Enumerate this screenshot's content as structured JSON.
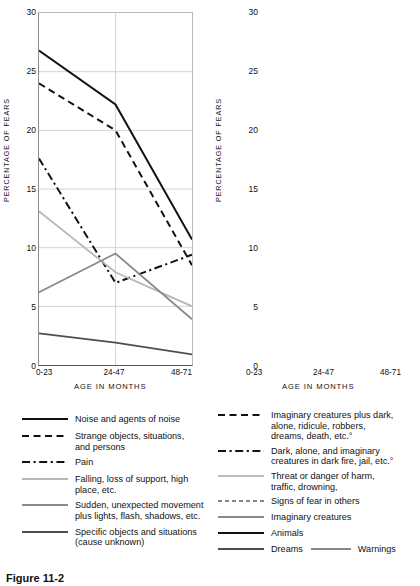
{
  "figure": {
    "caption": "Figure  11-2"
  },
  "axes": {
    "ylabel": "PERCENTAGE  OF  FEARS",
    "xlabel": "AGE  IN  MONTHS",
    "yticks": [
      "0",
      "5",
      "10",
      "15",
      "20",
      "25",
      "30"
    ],
    "xticks": [
      "0-23",
      "24-47",
      "48-71"
    ]
  },
  "chart_data": [
    {
      "type": "line",
      "title": "",
      "xlabel": "AGE  IN  MONTHS",
      "ylabel": "PERCENTAGE  OF  FEARS",
      "categories": [
        "0-23",
        "24-47",
        "48-71"
      ],
      "ylim": [
        0,
        30
      ],
      "yticks": [
        0,
        5,
        10,
        15,
        20,
        25,
        30
      ],
      "grid": true,
      "legend_position": "below",
      "series": [
        {
          "name": "Noise and  agents of noise",
          "values": [
            26.8,
            22.2,
            10.7
          ],
          "style": "solid",
          "color": "#111111",
          "width": 2.0
        },
        {
          "name": "Strange objects, situations,\n    and persons",
          "values": [
            24.0,
            20.0,
            8.5
          ],
          "style": "dashed",
          "color": "#111111",
          "width": 2.0
        },
        {
          "name": "Pain",
          "values": [
            17.6,
            7.0,
            9.4
          ],
          "style": "dashdot",
          "color": "#111111",
          "width": 2.0
        },
        {
          "name": "Falling, loss of support, high\n    place, etc.",
          "values": [
            13.1,
            7.9,
            5.0
          ],
          "style": "solid",
          "color": "#b8b8b8",
          "width": 1.8
        },
        {
          "name": "Sudden, unexpected movement\n    plus lights,  flash, shadows, etc.",
          "values": [
            6.2,
            9.5,
            3.9
          ],
          "style": "solid",
          "color": "#8a8a8a",
          "width": 1.8
        },
        {
          "name": "Specific objects and  situations\n    (cause unknown)",
          "values": [
            2.7,
            1.9,
            0.9
          ],
          "style": "solid",
          "color": "#4e4e4e",
          "width": 1.8
        }
      ]
    },
    {
      "type": "line",
      "title": "",
      "xlabel": "AGE  IN  MONTHS",
      "ylabel": "PERCENTAGE  OF  FEARS",
      "categories": [
        "0-23",
        "24-47",
        "48-71"
      ],
      "ylim": [
        0,
        30
      ],
      "yticks": [
        0,
        5,
        10,
        15,
        20,
        25,
        30
      ],
      "grid": true,
      "legend_position": "below",
      "series": [
        {
          "name": "Imaginary creatures plus dark,\n    alone, ridicule, robbers,\n    dreams, death, etc.°",
          "values": [
            4.6,
            11.5,
            27.8
          ],
          "style": "dashed",
          "color": "#111111",
          "width": 2.0
        },
        {
          "name": "Dark, alone, and imaginary\n    creatures in dark fire, jail, etc.°",
          "values": [
            3.5,
            8.2,
            17.3
          ],
          "style": "dashdot",
          "color": "#111111",
          "width": 2.0
        },
        {
          "name": "Threat or danger of harm,\n    traffic, drowning,",
          "values": [
            1.0,
            4.2,
            14.2
          ],
          "style": "solid",
          "color": "#bcbcbc",
          "width": 1.8
        },
        {
          "name": "Signs of fear  in others",
          "values": [
            0.2,
            1.0,
            4.3
          ],
          "style": "dashed",
          "color": "#111111",
          "width": 1.1
        },
        {
          "name": "Imaginary   creatures",
          "values": [
            1.8,
            4.3,
            8.5
          ],
          "style": "solid",
          "color": "#8a8a8a",
          "width": 1.8
        },
        {
          "name": "Animals",
          "values": [
            7.3,
            18.8,
            17.7
          ],
          "style": "solid",
          "color": "#111111",
          "width": 2.0
        },
        {
          "name": "Dreams",
          "values": [
            0.7,
            2.1,
            2.0
          ],
          "style": "solid",
          "color": "#4e4e4e",
          "width": 1.8
        },
        {
          "name": "Warnings",
          "values": [
            0.2,
            1.1,
            4.4
          ],
          "style": "solid",
          "color": "#111111",
          "width": 1.1
        }
      ]
    }
  ],
  "legend_left": {
    "items": [
      {
        "label": "Noise and  agents of noise"
      },
      {
        "label": "Strange objects, situations,\n    and persons"
      },
      {
        "label": "Pain"
      },
      {
        "label": "Falling, loss of support, high\n    place, etc."
      },
      {
        "label": "Sudden, unexpected movement\n    plus lights,  flash, shadows, etc."
      },
      {
        "label": "Specific objects and  situations\n    (cause unknown)"
      }
    ]
  },
  "legend_right": {
    "items": [
      {
        "label": "Imaginary creatures plus dark,\n    alone, ridicule, robbers,\n    dreams, death, etc.°"
      },
      {
        "label": "Dark, alone, and imaginary\n    creatures in dark fire, jail, etc.°"
      },
      {
        "label": "Threat or danger of harm,\n    traffic, drowning,"
      },
      {
        "label": "Signs of fear  in others"
      },
      {
        "label": "Imaginary   creatures"
      },
      {
        "label": "Animals"
      },
      {
        "label": "Dreams"
      },
      {
        "label": "Warnings"
      }
    ]
  }
}
